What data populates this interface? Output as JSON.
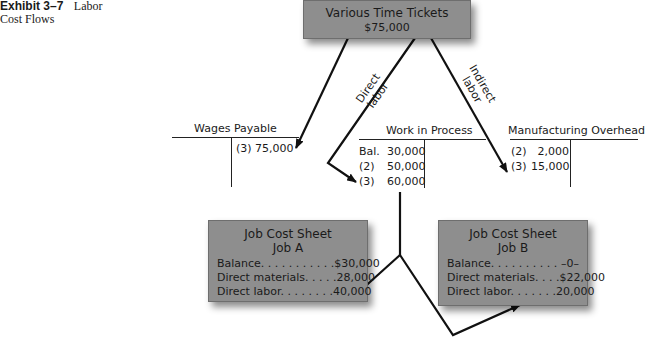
{
  "caption": {
    "exhibit": "Exhibit 3–7",
    "title_line1": "Labor",
    "title_line2": "Cost Flows"
  },
  "source": {
    "title": "Various Time Tickets",
    "amount": "$75,000"
  },
  "flow_labels": {
    "direct": [
      "Direct",
      "labor"
    ],
    "indirect": [
      "Indirect",
      "labor"
    ]
  },
  "t_accounts": {
    "wages_payable": {
      "title": "Wages Payable",
      "debits": [],
      "credits": [
        {
          "label": "(3)",
          "amount": "75,000"
        }
      ]
    },
    "work_in_process": {
      "title": "Work in Process",
      "debits": [
        {
          "label": "Bal.",
          "amount": "30,000"
        },
        {
          "label": "(2)",
          "amount": "50,000"
        },
        {
          "label": "(3)",
          "amount": "60,000"
        }
      ],
      "credits": []
    },
    "manufacturing_overhead": {
      "title": "Manufacturing Overhead",
      "debits": [
        {
          "label": "(2)",
          "amount": "2,000"
        },
        {
          "label": "(3)",
          "amount": "15,000"
        }
      ],
      "credits": []
    }
  },
  "job_cost_sheets": [
    {
      "title": "Job Cost Sheet",
      "job": "Job A",
      "rows": [
        {
          "label": "Balance. . . . . . . . . . .",
          "amount": "$30,000"
        },
        {
          "label": "Direct materials. . . . .",
          "amount": "28,000"
        },
        {
          "label": "Direct labor. . . . . . . .",
          "amount": "40,000"
        }
      ]
    },
    {
      "title": "Job Cost Sheet",
      "job": "Job B",
      "rows": [
        {
          "label": "Balance. . . . . . . . . .",
          "amount": "–0–"
        },
        {
          "label": "Direct materials. . . .",
          "amount": "$22,000"
        },
        {
          "label": "Direct labor. . . . . . .",
          "amount": "20,000"
        }
      ]
    }
  ],
  "colors": {
    "box_fill": "#8e8e8e",
    "line": "#111111"
  }
}
